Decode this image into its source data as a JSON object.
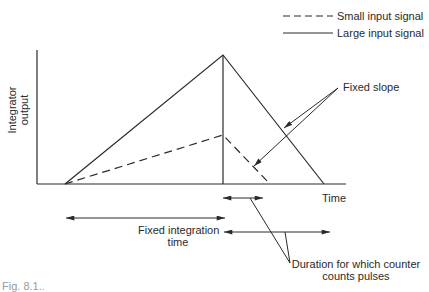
{
  "legend": {
    "items": [
      {
        "label": "Small input signal",
        "style": "dashed"
      },
      {
        "label": "Large input signal",
        "style": "solid"
      }
    ]
  },
  "axes": {
    "y_label_line1": "Integrator",
    "y_label_line2": "output",
    "x_label": "Time"
  },
  "annotations": {
    "fixed_slope": "Fixed slope",
    "fixed_integration_line1": "Fixed integration",
    "fixed_integration_line2": "time",
    "duration_line1": "Duration for which counter",
    "duration_line2": "counts pulses"
  },
  "caption": "Fig. 8.1..",
  "colors": {
    "ink": "#2a2a2a",
    "background": "#ffffff"
  }
}
